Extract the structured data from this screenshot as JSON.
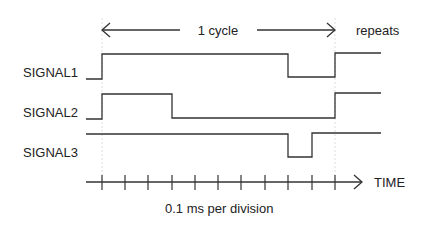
{
  "cycle_label": "1 cycle",
  "repeats_label": "repeats",
  "signals": [
    {
      "name": "SIGNAL1",
      "levels": "low, high 0-0.8ms, low 0.8-1.0ms, high"
    },
    {
      "name": "SIGNAL2",
      "levels": "low, high 0-0.3ms, low 0.3-1.0ms, high"
    },
    {
      "name": "SIGNAL3",
      "levels": "high 0-0.8ms, low 0.8-0.9ms, high"
    }
  ],
  "axis": {
    "label": "TIME",
    "divisions_shown": 12
  },
  "scale_label": "0.1 ms per division",
  "colors": {
    "line": "#333333",
    "text": "#222222",
    "guide": "#dddddd"
  }
}
